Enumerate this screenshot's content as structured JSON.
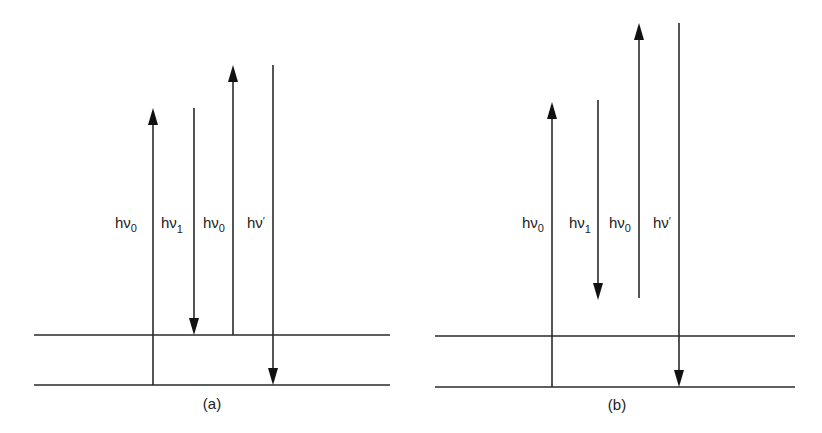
{
  "figure": {
    "colors": {
      "line": "#2a2a2a",
      "background": "#ffffff"
    },
    "panels": [
      {
        "id": "a",
        "caption": "(a)",
        "levels": [
          {
            "name": "upper-level",
            "y": 335,
            "x1": 34,
            "x2": 390
          },
          {
            "name": "ground-level",
            "y": 385,
            "x1": 34,
            "x2": 390
          }
        ],
        "arrows": [
          {
            "name": "h-nu-0-up-1",
            "direction": "up",
            "x": 153,
            "y_start": 385,
            "y_end": 108,
            "label_main": "hν",
            "label_sub": "0",
            "label_x": 115,
            "label_y": 222
          },
          {
            "name": "h-nu-1-down",
            "direction": "down",
            "x": 194,
            "y_start": 108,
            "y_end": 335,
            "label_main": "hν",
            "label_sub": "1",
            "label_x": 160,
            "label_y": 222
          },
          {
            "name": "h-nu-0-up-2",
            "direction": "up",
            "x": 233,
            "y_start": 335,
            "y_end": 65,
            "label_main": "hν",
            "label_sub": "0",
            "label_x": 203,
            "label_y": 222
          },
          {
            "name": "h-nu-prime-down",
            "direction": "down",
            "x": 273,
            "y_start": 65,
            "y_end": 385,
            "label_main": "hν",
            "label_sub": "′",
            "label_x": 245,
            "label_y": 222
          }
        ]
      },
      {
        "id": "b",
        "caption": "(b)",
        "levels": [
          {
            "name": "upper-level",
            "y": 336,
            "x1": 435,
            "x2": 795
          },
          {
            "name": "ground-level",
            "y": 387,
            "x1": 435,
            "x2": 795
          }
        ],
        "arrows": [
          {
            "name": "h-nu-0-up-1",
            "direction": "up",
            "x": 552,
            "y_start": 387,
            "y_end": 102,
            "label_main": "hν",
            "label_sub": "0",
            "label_x": 522,
            "label_y": 222
          },
          {
            "name": "h-nu-1-down",
            "direction": "down",
            "x": 598,
            "y_start": 100,
            "y_end": 300,
            "label_main": "hν",
            "label_sub": "1",
            "label_x": 568,
            "label_y": 222
          },
          {
            "name": "h-nu-0-up-2",
            "direction": "up",
            "x": 639,
            "y_start": 298,
            "y_end": 23,
            "label_main": "hν",
            "label_sub": "0",
            "label_x": 608,
            "label_y": 222
          },
          {
            "name": "h-nu-prime-down",
            "direction": "down",
            "x": 679,
            "y_start": 23,
            "y_end": 387,
            "label_main": "hν",
            "label_sub": "′",
            "label_x": 651,
            "label_y": 222
          }
        ]
      }
    ]
  },
  "captions": {
    "a": "(a)",
    "b": "(b)"
  },
  "labels": {
    "a": {
      "l1": {
        "main": "hν",
        "sub": "0"
      },
      "l2": {
        "main": "hν",
        "sub": "1"
      },
      "l3": {
        "main": "hν",
        "sub": "0"
      },
      "l4": {
        "main": "hν",
        "sub": "′"
      }
    },
    "b": {
      "l1": {
        "main": "hν",
        "sub": "0"
      },
      "l2": {
        "main": "hν",
        "sub": "1"
      },
      "l3": {
        "main": "hν",
        "sub": "0"
      },
      "l4": {
        "main": "hν",
        "sub": "′"
      }
    }
  }
}
